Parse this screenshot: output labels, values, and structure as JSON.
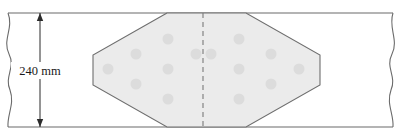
{
  "diagram": {
    "dimension": {
      "label": "240 mm",
      "value": 240,
      "unit": "mm",
      "orientation": "vertical",
      "measures": "plate-height",
      "arrow_top_y": 13,
      "arrow_bottom_y": 127
    },
    "colors": {
      "outline": "#6b6b6b",
      "shade_fill": "#ebebeb",
      "shade_stroke": "#6e6e6e",
      "dot_fill": "#dcdcdc",
      "centerline": "#7a7a7a",
      "dimension_line": "#2b2b2b",
      "label_text": "#1a1a1a",
      "background": "#ffffff"
    },
    "plate": {
      "name": "plate-body",
      "top_y": 13,
      "bottom_y": 127,
      "left_break_x": 8,
      "right_break_x": 393,
      "break_style": "wavy"
    },
    "shaded_zone": {
      "name": "hexagonal-shaded-zone",
      "shape": "hexagon",
      "points": "167,13 93,55 93,85 167,127 246,127 320,85 320,55 246,13",
      "left_vertex_x": 93,
      "right_vertex_x": 320,
      "top_edge_y": 13,
      "bottom_edge_y": 127
    },
    "centerline": {
      "name": "centerline",
      "x": 203,
      "style": "dashed",
      "top_y": 13,
      "bottom_y": 127
    },
    "dots": {
      "name": "dot-pattern",
      "radius": 5.5,
      "count": 14,
      "positions": [
        {
          "cx": 108,
          "cy": 69
        },
        {
          "cx": 136,
          "cy": 54
        },
        {
          "cx": 136,
          "cy": 84
        },
        {
          "cx": 168,
          "cy": 39
        },
        {
          "cx": 168,
          "cy": 69
        },
        {
          "cx": 168,
          "cy": 99
        },
        {
          "cx": 196,
          "cy": 54
        },
        {
          "cx": 211,
          "cy": 54
        },
        {
          "cx": 239,
          "cy": 39
        },
        {
          "cx": 239,
          "cy": 69
        },
        {
          "cx": 239,
          "cy": 99
        },
        {
          "cx": 271,
          "cy": 54
        },
        {
          "cx": 271,
          "cy": 84
        },
        {
          "cx": 299,
          "cy": 69
        }
      ]
    }
  }
}
